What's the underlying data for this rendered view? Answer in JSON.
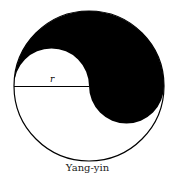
{
  "figure": {
    "caption": "Yang-yin",
    "radius_label": "r",
    "colors": {
      "fill": "#000000",
      "stroke": "#000000",
      "background": "#ffffff"
    }
  }
}
